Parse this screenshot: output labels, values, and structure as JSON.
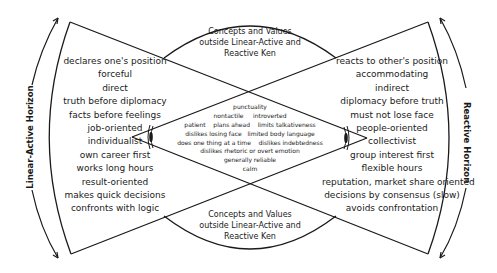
{
  "diagram": {
    "left_horizon_label": "Linear-Active Horizon",
    "right_horizon_label": "Reactive Horizon",
    "top_concept": [
      "Concepts and Values",
      "outside Linear-Active and",
      "Reactive Ken"
    ],
    "bottom_concept": [
      "Concepts and Values",
      "outside Linear-Active and",
      "Reactive Ken"
    ],
    "linear_active_traits": [
      "declares one's position",
      "forceful",
      "direct",
      "truth before diplomacy",
      "facts before feelings",
      "job-oriented",
      "individualist",
      "own career first",
      "works long hours",
      "result-oriented",
      "makes quick decisions",
      "confronts with logic"
    ],
    "reactive_traits": [
      "reacts to other's position",
      "accommodating",
      "indirect",
      "diplomacy before truth",
      "must not lose face",
      "people-oriented",
      "collectivist",
      "group interest first",
      "flexible hours",
      "reputation, market share oriented",
      "decisions by consensus (slow)",
      "avoids confrontation"
    ],
    "shared_traits": [
      [
        "punctuality"
      ],
      [
        "nontactile",
        "introverted"
      ],
      [
        "patient",
        "plans ahead",
        "limits talkativeness"
      ],
      [
        "dislikes losing face",
        "limited body language"
      ],
      [
        "does one thing at a time",
        "dislikes indebtedness"
      ],
      [
        "dislikes rhetoric or overt emotion"
      ],
      [
        "generally reliable"
      ],
      [
        "calm"
      ]
    ],
    "icons": {
      "left_eye": "eye-icon",
      "right_eye": "eye-icon"
    },
    "colors": {
      "line": "#1a1a1a",
      "background": "#ffffff"
    }
  }
}
